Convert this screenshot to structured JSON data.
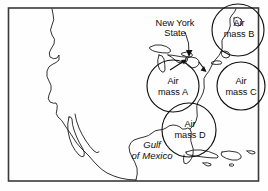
{
  "figure": {
    "name": "weather-map-air-masses",
    "background_color": "#fefefe",
    "border_color": "#3a3a3a",
    "ink_color": "#111111"
  },
  "labels": {
    "new_york_line1": "New York",
    "new_york_line2": "State",
    "air_mass_a_line1": "Air",
    "air_mass_a_line2": "mass A",
    "air_mass_b_line1": "Air",
    "air_mass_b_line2": "mass B",
    "air_mass_c_line1": "Air",
    "air_mass_c_line2": "mass C",
    "air_mass_d_line1": "Air",
    "air_mass_d_line2": "mass D",
    "gulf_line1": "Gulf",
    "gulf_line2": "of Mexico"
  },
  "air_masses": [
    {
      "id": "A",
      "label": "Air mass A",
      "cx": 173,
      "cy": 86,
      "r": 26
    },
    {
      "id": "B",
      "label": "Air mass B",
      "cx": 238,
      "cy": 30,
      "r": 26
    },
    {
      "id": "C",
      "label": "Air mass C",
      "cx": 241,
      "cy": 86,
      "r": 24
    },
    {
      "id": "D",
      "label": "Air mass D",
      "cx": 189,
      "cy": 130,
      "r": 27
    }
  ],
  "annotations": {
    "new_york_leader": "curved leader line from label to New York State",
    "arrow_to_coast": "arrow pointing toward the Atlantic coast"
  }
}
